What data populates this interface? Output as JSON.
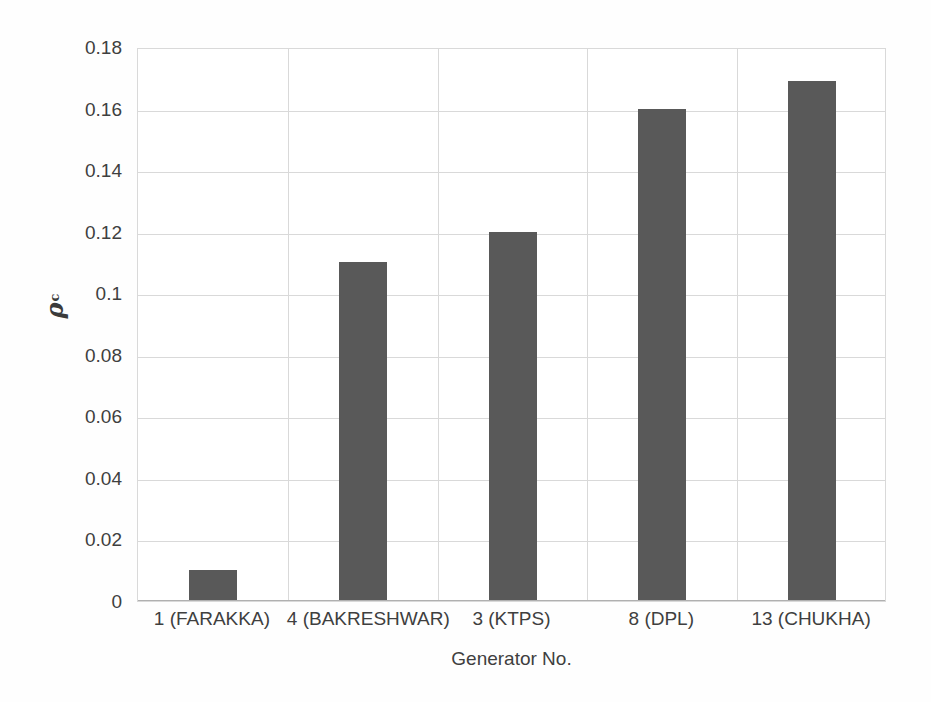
{
  "chart_data": {
    "type": "bar",
    "title": "",
    "categories": [
      "1 (FARAKKA)",
      "4 (BAKRESHWAR)",
      "3 (KTPS)",
      "8 (DPL)",
      "13 (CHUKHA)"
    ],
    "values": [
      0.01,
      0.11,
      0.12,
      0.16,
      0.169
    ],
    "xlabel": "Generator No.",
    "ylabel": "ρc",
    "ylabel_symbol": "ρ",
    "ylabel_subscript": "c",
    "ylim": [
      0,
      0.18
    ],
    "ytick_labels": [
      "0",
      "0.02",
      "0.04",
      "0.06",
      "0.08",
      "0.1",
      "0.12",
      "0.14",
      "0.16",
      "0.18"
    ],
    "ytick_values": [
      0,
      0.02,
      0.04,
      0.06,
      0.08,
      0.1,
      0.12,
      0.14,
      0.16,
      0.18
    ],
    "grid": "horizontal-and-category-separators",
    "legend": "none",
    "bar_color": "#595959",
    "gridline_color": "#d9d9d9",
    "text_color": "#3f3f3f",
    "background_color": "#ffffff"
  }
}
